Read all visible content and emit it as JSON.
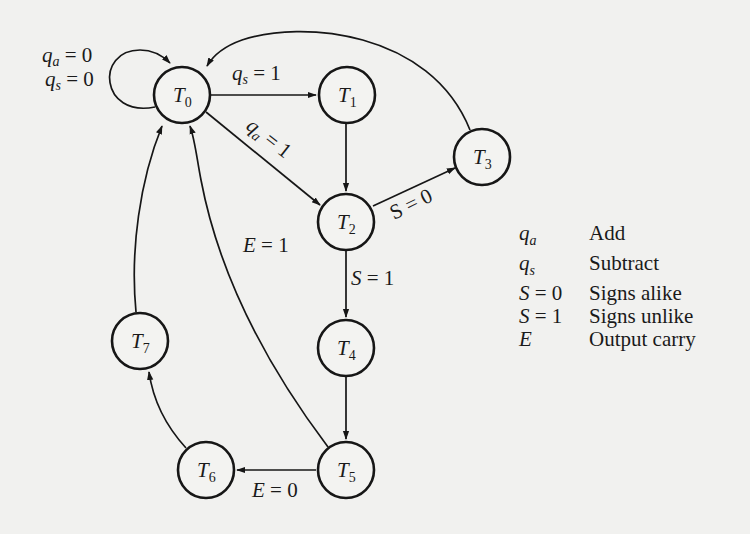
{
  "figure": {
    "type": "state-diagram"
  },
  "nodes": [
    {
      "id": "T0",
      "base": "T",
      "sub": "0",
      "cx": 182,
      "cy": 95
    },
    {
      "id": "T1",
      "base": "T",
      "sub": "1",
      "cx": 347,
      "cy": 95
    },
    {
      "id": "T2",
      "base": "T",
      "sub": "2",
      "cx": 346,
      "cy": 222
    },
    {
      "id": "T3",
      "base": "T",
      "sub": "3",
      "cx": 482,
      "cy": 157
    },
    {
      "id": "T4",
      "base": "T",
      "sub": "4",
      "cx": 346,
      "cy": 348
    },
    {
      "id": "T5",
      "base": "T",
      "sub": "5",
      "cx": 346,
      "cy": 470
    },
    {
      "id": "T6",
      "base": "T",
      "sub": "6",
      "cx": 206,
      "cy": 470
    },
    {
      "id": "T7",
      "base": "T",
      "sub": "7",
      "cx": 140,
      "cy": 341
    }
  ],
  "edges": [
    {
      "from": "T0",
      "to": "T0",
      "label_lines": [
        "qa = 0",
        "qs = 0"
      ]
    },
    {
      "from": "T0",
      "to": "T1",
      "label": "qs = 1"
    },
    {
      "from": "T0",
      "to": "T2",
      "label": "qa = 1"
    },
    {
      "from": "T1",
      "to": "T2",
      "label": ""
    },
    {
      "from": "T2",
      "to": "T3",
      "label": "S = 0"
    },
    {
      "from": "T2",
      "to": "T4",
      "label": "S = 1"
    },
    {
      "from": "T3",
      "to": "T0",
      "label": ""
    },
    {
      "from": "T4",
      "to": "T5",
      "label": ""
    },
    {
      "from": "T5",
      "to": "T0",
      "label": "E = 1"
    },
    {
      "from": "T5",
      "to": "T6",
      "label": "E = 0"
    },
    {
      "from": "T6",
      "to": "T7",
      "label": ""
    },
    {
      "from": "T7",
      "to": "T0",
      "label": ""
    }
  ],
  "edge_labels": {
    "self_loop_qa": {
      "var": "q",
      "sub": "a",
      "rest": " = 0"
    },
    "self_loop_qs": {
      "var": "q",
      "sub": "s",
      "rest": " = 0"
    },
    "t0_t1": {
      "var": "q",
      "sub": "s",
      "rest": " = 1"
    },
    "t0_t2": {
      "var": "q",
      "sub": "a",
      "rest": " = 1"
    },
    "t2_t3": {
      "text": "S = 0"
    },
    "t2_t4": {
      "var": "S",
      "rest": " = 1"
    },
    "t5_t0": {
      "var": "E",
      "rest": " = 1"
    },
    "t5_t6": {
      "var": "E",
      "rest": " = 0"
    }
  },
  "legend": [
    {
      "sym": "q",
      "sub": "a",
      "eq": "",
      "desc": "Add"
    },
    {
      "sym": "q",
      "sub": "s",
      "eq": "",
      "desc": "Subtract"
    },
    {
      "sym": "S",
      "sub": "",
      "eq": " = 0",
      "desc": "Signs alike"
    },
    {
      "sym": "S",
      "sub": "",
      "eq": " = 1",
      "desc": "Signs unlike"
    },
    {
      "sym": "E",
      "sub": "",
      "eq": "",
      "desc": "Output carry"
    }
  ],
  "colors": {
    "ink": "#161616",
    "paper": "#f1f1ef"
  }
}
